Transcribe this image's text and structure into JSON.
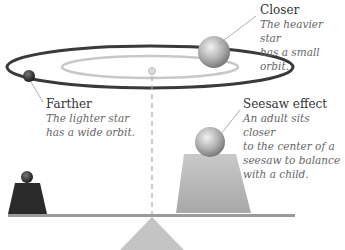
{
  "labels": {
    "closer": {
      "title": "Closer",
      "desc_line1": "The heavier star",
      "desc_line2": "has a small orbit."
    },
    "farther": {
      "title": "Farther",
      "desc_line1": "The lighter star",
      "desc_line2": "has a wide orbit."
    },
    "seesaw": {
      "title": "Seesaw effect",
      "desc_line1": "An adult sits closer",
      "desc_line2": "to the center of a",
      "desc_line3": "seesaw to balance",
      "desc_line4": "with a child."
    }
  },
  "colors": {
    "outer_orbit": "#3a3a3a",
    "inner_orbit": "#c8c8c8",
    "heavy_star": "#b5b5b5",
    "light_star": "#333333",
    "board": "#9a9a9a",
    "fulcrum": "#c4c4c4"
  }
}
